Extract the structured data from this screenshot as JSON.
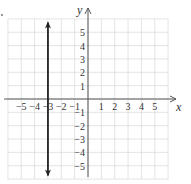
{
  "chart_data": {
    "type": "line",
    "title": "",
    "xlabel": "x",
    "ylabel": "y",
    "xlim": [
      -6,
      6
    ],
    "ylim": [
      -6,
      6
    ],
    "grid": true,
    "x_ticks": [
      -5,
      -4,
      -3,
      -2,
      -1,
      1,
      2,
      3,
      4,
      5
    ],
    "y_ticks": [
      -5,
      -4,
      -3,
      -2,
      -1,
      1,
      2,
      3,
      4,
      5
    ],
    "x_tick_labels": [
      "−5",
      "−4",
      "−3",
      "−2",
      "−1",
      "1",
      "2",
      "3",
      "4",
      "5"
    ],
    "y_tick_labels": [
      "−5",
      "−4",
      "−3",
      "−2",
      "−1",
      "1",
      "2",
      "3",
      "4",
      "5"
    ],
    "series": [
      {
        "name": "x = -3",
        "type": "vertical-line",
        "x": [
          -3,
          -3
        ],
        "y": [
          -5.8,
          5.8
        ],
        "arrows": "both",
        "color": "#222222"
      }
    ]
  },
  "colors": {
    "grid": "#d9d9d9",
    "axis": "#555555",
    "line": "#222222"
  }
}
